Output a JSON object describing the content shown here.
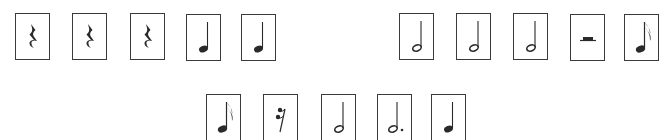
{
  "rows": [
    {
      "name": "top-left-group",
      "cards": [
        {
          "symbol": "quarter-rest",
          "x": 15,
          "y": 13
        },
        {
          "symbol": "quarter-rest",
          "x": 72,
          "y": 13
        },
        {
          "symbol": "quarter-rest",
          "x": 130,
          "y": 13
        },
        {
          "symbol": "quarter-note",
          "x": 186,
          "y": 14
        },
        {
          "symbol": "quarter-note",
          "x": 241,
          "y": 14
        }
      ]
    },
    {
      "name": "top-right-group",
      "cards": [
        {
          "symbol": "half-note",
          "x": 399,
          "y": 13
        },
        {
          "symbol": "half-note",
          "x": 456,
          "y": 13
        },
        {
          "symbol": "half-note",
          "x": 513,
          "y": 13
        },
        {
          "symbol": "half-rest",
          "x": 570,
          "y": 14
        },
        {
          "symbol": "sixteenth-note",
          "x": 624,
          "y": 14
        }
      ]
    },
    {
      "name": "bottom-group",
      "cards": [
        {
          "symbol": "sixteenth-note",
          "x": 206,
          "y": 94
        },
        {
          "symbol": "sixteenth-rest",
          "x": 263,
          "y": 94
        },
        {
          "symbol": "half-note",
          "x": 321,
          "y": 94
        },
        {
          "symbol": "dotted-half-note",
          "x": 377,
          "y": 94
        },
        {
          "symbol": "quarter-note",
          "x": 431,
          "y": 94
        }
      ]
    }
  ],
  "colors": {
    "ink": "#2a2a2a",
    "border": "#3a3a3a",
    "background": "#ffffff"
  }
}
